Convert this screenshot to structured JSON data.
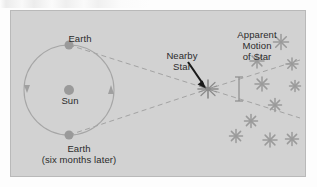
{
  "figure": {
    "type": "stellar-parallax-diagram",
    "background_color": "#d2d2d2",
    "border_color": "#b9b9b9",
    "labels": {
      "earth_top": "Earth",
      "sun": "Sun",
      "earth_bottom_line1": "Earth",
      "earth_bottom_line2": "(six months later)",
      "nearby_star_line1": "Nearby",
      "nearby_star_line2": "Star",
      "apparent_motion_line1": "Apparent",
      "apparent_motion_line2": "Motion",
      "apparent_motion_line3": "of Star"
    },
    "elements": {
      "sun": {
        "name": "sun",
        "cx": 58,
        "cy": 79,
        "r": 5,
        "color": "#9a9a9a"
      },
      "orbit": {
        "name": "earth-orbit",
        "cx": 58,
        "cy": 79,
        "r": 45,
        "stroke": "#a6a6a6"
      },
      "earth_top": {
        "name": "earth-position-a",
        "cx": 58,
        "cy": 34,
        "r": 4.5,
        "color": "#9a9a9a"
      },
      "earth_bottom": {
        "name": "earth-position-b",
        "cx": 58,
        "cy": 124,
        "r": 4.5,
        "color": "#9a9a9a"
      },
      "nearby_star": {
        "name": "nearby-star",
        "cx": 197,
        "cy": 78,
        "color": "#8f8f8f"
      },
      "motion_indicator": {
        "name": "apparent-motion-extent",
        "x": 228,
        "y_top": 66,
        "y_bottom": 90,
        "color": "#8c8c8c"
      },
      "pointer_arrow": {
        "name": "nearby-star-pointer",
        "x1": 178,
        "y1": 52,
        "x2": 194,
        "y2": 75,
        "color": "#1a1a1a"
      }
    },
    "sight_lines": [
      {
        "name": "sight-line-from-earth-a",
        "from": [
          58,
          34
        ],
        "via": [
          197,
          78
        ],
        "to": [
          288,
          107
        ]
      },
      {
        "name": "sight-line-from-earth-b",
        "from": [
          58,
          124
        ],
        "via": [
          197,
          78
        ],
        "to": [
          288,
          49
        ]
      }
    ],
    "star_field": [
      {
        "cx": 270,
        "cy": 31,
        "r": 7.5
      },
      {
        "cx": 246,
        "cy": 50,
        "r": 7
      },
      {
        "cx": 281,
        "cy": 53,
        "r": 6
      },
      {
        "cx": 251,
        "cy": 73,
        "r": 7
      },
      {
        "cx": 284,
        "cy": 75,
        "r": 5.5
      },
      {
        "cx": 264,
        "cy": 94,
        "r": 6.5
      },
      {
        "cx": 240,
        "cy": 110,
        "r": 6.5
      },
      {
        "cx": 225,
        "cy": 125,
        "r": 6.5
      },
      {
        "cx": 259,
        "cy": 129,
        "r": 7
      },
      {
        "cx": 281,
        "cy": 128,
        "r": 6.5
      }
    ],
    "star_field_color": "#9a9a9a"
  }
}
